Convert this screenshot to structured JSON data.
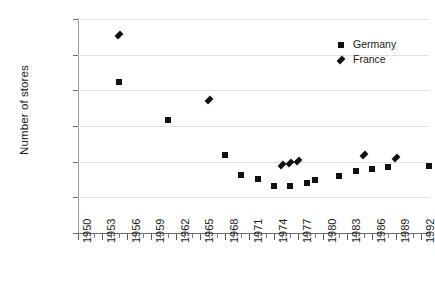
{
  "chart_data": {
    "type": "scatter",
    "title": "",
    "xlabel": "",
    "ylabel": "Number of stores",
    "xlim": [
      1950,
      1993
    ],
    "ylim": [
      200000,
      800000
    ],
    "ytick_values": [
      200000,
      300000,
      400000,
      500000,
      600000,
      700000,
      800000
    ],
    "ytick_labels": [
      "200,000",
      "300,000",
      "400,000",
      "500,000",
      "600,000",
      "700,000",
      "800,000"
    ],
    "xtick_labels": [
      "1950",
      "1953",
      "1956",
      "1959",
      "1962",
      "1965",
      "1968",
      "1971",
      "1974",
      "1977",
      "1980",
      "1983",
      "1986",
      "1989",
      "1992"
    ],
    "xtick_values": [
      1950,
      1953,
      1956,
      1959,
      1962,
      1965,
      1968,
      1971,
      1974,
      1977,
      1980,
      1983,
      1986,
      1989,
      1992
    ],
    "grid": "horizontal",
    "legend_position": "top-right",
    "series": [
      {
        "name": "Germany",
        "marker": "square",
        "color": "#111111",
        "points": [
          {
            "x": 1955,
            "y": 622000
          },
          {
            "x": 1961,
            "y": 518000
          },
          {
            "x": 1968,
            "y": 420000
          },
          {
            "x": 1970,
            "y": 363000
          },
          {
            "x": 1972,
            "y": 352000
          },
          {
            "x": 1974,
            "y": 333000
          },
          {
            "x": 1976,
            "y": 333000
          },
          {
            "x": 1978,
            "y": 339000
          },
          {
            "x": 1979,
            "y": 348000
          },
          {
            "x": 1982,
            "y": 360000
          },
          {
            "x": 1984,
            "y": 374000
          },
          {
            "x": 1986,
            "y": 380000
          },
          {
            "x": 1988,
            "y": 386000
          },
          {
            "x": 1993,
            "y": 389000
          }
        ]
      },
      {
        "name": "France",
        "marker": "diamond",
        "color": "#111111",
        "points": [
          {
            "x": 1955,
            "y": 755000
          },
          {
            "x": 1966,
            "y": 572000
          },
          {
            "x": 1975,
            "y": 390000
          },
          {
            "x": 1976,
            "y": 395000
          },
          {
            "x": 1977,
            "y": 403000
          },
          {
            "x": 1985,
            "y": 420000
          },
          {
            "x": 1989,
            "y": 411000
          }
        ]
      }
    ]
  },
  "legend": {
    "items": [
      {
        "label": "Germany",
        "marker": "square"
      },
      {
        "label": "France",
        "marker": "diamond"
      }
    ]
  }
}
